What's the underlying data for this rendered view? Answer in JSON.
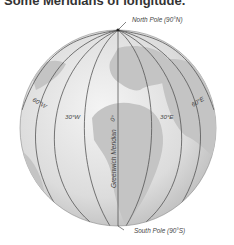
{
  "heading": "Some Meridians of longitude.",
  "figure": {
    "north_pole": "North Pole (90°N)",
    "south_pole": "South Pole (90°S)",
    "prime_meridian": "Greenwich Meridian",
    "meridians": [
      {
        "label": "60°W"
      },
      {
        "label": "30°W"
      },
      {
        "label": "0°"
      },
      {
        "label": "30°E"
      },
      {
        "label": "60°E"
      }
    ]
  },
  "colors": {
    "ocean": "#d9d9d9",
    "land": "#bdbdbd",
    "lines": "#555555",
    "text": "#444444"
  }
}
